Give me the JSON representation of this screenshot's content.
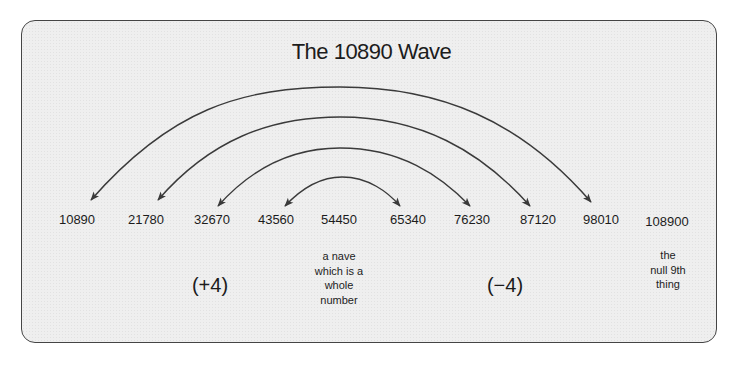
{
  "diagram": {
    "title": "The 10890 Wave",
    "numbers": [
      {
        "value": "10890",
        "x": 77
      },
      {
        "value": "21780",
        "x": 146
      },
      {
        "value": "32670",
        "x": 212
      },
      {
        "value": "43560",
        "x": 276
      },
      {
        "value": "54450",
        "x": 339
      },
      {
        "value": "65340",
        "x": 408
      },
      {
        "value": "76230",
        "x": 472
      },
      {
        "value": "87120",
        "x": 538
      },
      {
        "value": "98010",
        "x": 601
      },
      {
        "value": "108900",
        "x": 667
      }
    ],
    "arcs": [
      {
        "from": "10890",
        "to": "98010",
        "double_headed": true
      },
      {
        "from": "21780",
        "to": "87120",
        "double_headed": true
      },
      {
        "from": "32670",
        "to": "76230",
        "double_headed": true
      },
      {
        "from": "43560",
        "to": "65340",
        "double_headed": true
      }
    ],
    "left_label": "(+4)",
    "right_label": "(−4)",
    "center_note": [
      "a nave",
      "which is a",
      "whole",
      "number"
    ],
    "end_note": [
      "the",
      "null 9th",
      "thing"
    ]
  },
  "colors": {
    "panel_fill": "#efefef",
    "border": "#454545",
    "arc_stroke": "#3a3a3a",
    "text": "#1c1c1c"
  }
}
